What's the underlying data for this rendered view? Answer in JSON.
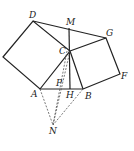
{
  "diagram": {
    "points": {
      "E": [
        3,
        57
      ],
      "D": [
        33,
        21
      ],
      "M": [
        69,
        28
      ],
      "G": [
        106,
        38
      ],
      "C": [
        70,
        51
      ],
      "F": [
        120,
        74
      ],
      "A": [
        40,
        89
      ],
      "P": [
        58,
        86
      ],
      "H": [
        70,
        89
      ],
      "B": [
        83,
        89
      ],
      "N": [
        53,
        125
      ]
    },
    "labels": {
      "D": "D",
      "M": "M",
      "G": "G",
      "C": "C",
      "F": "F",
      "A": "A",
      "P": "P",
      "H": "H",
      "B": "B",
      "N": "N"
    },
    "solid_segments": [
      [
        "E",
        "D"
      ],
      [
        "D",
        "C"
      ],
      [
        "C",
        "A"
      ],
      [
        "A",
        "E"
      ],
      [
        "D",
        "G"
      ],
      [
        "C",
        "G"
      ],
      [
        "G",
        "F"
      ],
      [
        "F",
        "B"
      ],
      [
        "B",
        "C"
      ],
      [
        "A",
        "B"
      ],
      [
        "M",
        "H"
      ]
    ],
    "dashed_segments": [
      [
        "A",
        "N"
      ],
      [
        "B",
        "N"
      ],
      [
        "C",
        "N"
      ],
      [
        "P",
        "N"
      ]
    ]
  }
}
